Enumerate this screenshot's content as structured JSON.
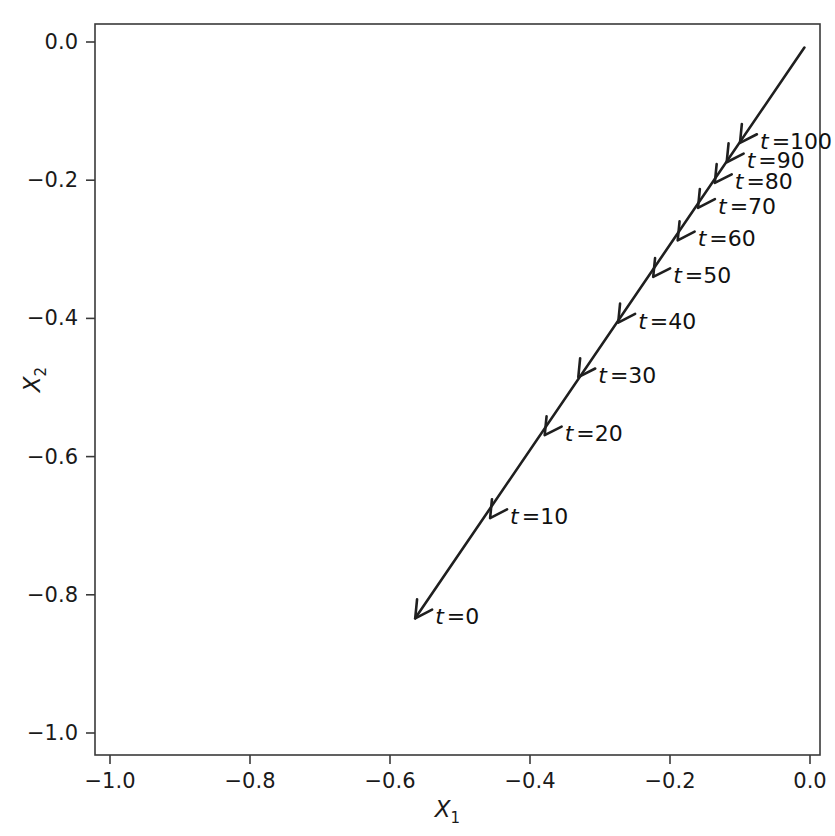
{
  "figure": {
    "background_color": "#ffffff",
    "line_color": "#1f1f1f",
    "axis_color": "#3a3a3a"
  },
  "chart_data": {
    "type": "line",
    "title": "",
    "subtitle": "",
    "xlabel": "X_1",
    "ylabel": "X_2",
    "xlabel_base": "X",
    "xlabel_sub": "1",
    "ylabel_base": "X",
    "ylabel_sub": "2",
    "xlim": [
      -1.08,
      0.02
    ],
    "ylim": [
      -1.04,
      0.04
    ],
    "xticks": [
      -1.0,
      -0.8,
      -0.6,
      -0.4,
      -0.2,
      0.0
    ],
    "xticklabels": [
      "−1.0",
      "−0.8",
      "−0.6",
      "−0.4",
      "−0.2",
      "0.0"
    ],
    "yticks": [
      0.0,
      -0.2,
      -0.4,
      -0.6,
      -0.8,
      -1.0
    ],
    "yticklabels": [
      "0.0",
      "−0.2",
      "−0.4",
      "−0.6",
      "−0.8",
      "−1.0"
    ],
    "grid": false,
    "legend": null,
    "legend_position": "none",
    "series": [
      {
        "name": "trajectory",
        "marker": "arrow",
        "direction": "toward-origin-reversed",
        "x": [
          -0.564,
          -0.457,
          -0.379,
          -0.331,
          -0.274,
          -0.224,
          -0.189,
          -0.16,
          -0.136,
          -0.119,
          -0.1
        ],
        "y": [
          -0.834,
          -0.689,
          -0.569,
          -0.485,
          -0.406,
          -0.34,
          -0.287,
          -0.24,
          -0.204,
          -0.174,
          -0.146
        ],
        "t": [
          0,
          10,
          20,
          30,
          40,
          50,
          60,
          70,
          80,
          90,
          100
        ]
      }
    ],
    "line_start": {
      "x": -0.008,
      "y": -0.008
    },
    "line_end": {
      "x": -0.564,
      "y": -0.834
    },
    "annotations": [
      {
        "label": "t = 0",
        "t": 0,
        "x": -0.564,
        "y": -0.834,
        "label_dx": 20,
        "label_dy": 6
      },
      {
        "label": "t = 10",
        "t": 10,
        "x": -0.457,
        "y": -0.689,
        "label_dx": 20,
        "label_dy": 6
      },
      {
        "label": "t = 20",
        "t": 20,
        "x": -0.379,
        "y": -0.569,
        "label_dx": 20,
        "label_dy": 6
      },
      {
        "label": "t = 30",
        "t": 30,
        "x": -0.331,
        "y": -0.485,
        "label_dx": 20,
        "label_dy": 6
      },
      {
        "label": "t = 40",
        "t": 40,
        "x": -0.274,
        "y": -0.406,
        "label_dx": 20,
        "label_dy": 6
      },
      {
        "label": "t = 50",
        "t": 50,
        "x": -0.224,
        "y": -0.34,
        "label_dx": 20,
        "label_dy": 6
      },
      {
        "label": "t = 60",
        "t": 60,
        "x": -0.189,
        "y": -0.287,
        "label_dx": 20,
        "label_dy": 6
      },
      {
        "label": "t = 70",
        "t": 70,
        "x": -0.16,
        "y": -0.24,
        "label_dx": 20,
        "label_dy": 6
      },
      {
        "label": "t = 80",
        "t": 80,
        "x": -0.136,
        "y": -0.204,
        "label_dx": 20,
        "label_dy": 6
      },
      {
        "label": "t = 90",
        "t": 90,
        "x": -0.119,
        "y": -0.174,
        "label_dx": 20,
        "label_dy": 6
      },
      {
        "label": "t = 100",
        "t": 100,
        "x": -0.1,
        "y": -0.146,
        "label_dx": 20,
        "label_dy": 6
      }
    ]
  },
  "plot_geometry": {
    "frame_left": 95,
    "frame_top": 24,
    "frame_right": 820,
    "frame_bottom": 755,
    "x_pixel_at_minus1": 110,
    "x_pixel_at_0": 810,
    "y_pixel_at_0": 42,
    "y_pixel_at_minus1": 733,
    "tick_length": 9
  }
}
